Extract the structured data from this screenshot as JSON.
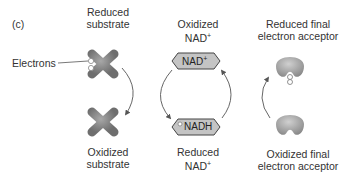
{
  "panel_label": "(c)",
  "left_column": {
    "top_label_line1": "Reduced",
    "top_label_line2": "substrate",
    "bottom_label_line1": "Oxidized",
    "bottom_label_line2": "substrate",
    "callout": "Electrons"
  },
  "middle_column": {
    "top_label_line1": "Oxidized",
    "top_label_line2": "NAD",
    "top_label_sup": "+",
    "top_hex_text": "NAD",
    "top_hex_sup": "+",
    "bottom_hex_text": "NADH",
    "bottom_label_line1": "Reduced",
    "bottom_label_line2": "NAD",
    "bottom_label_sup": "+"
  },
  "right_column": {
    "top_label_line1": "Reduced final",
    "top_label_line2": "electron acceptor",
    "bottom_label_line1": "Oxidized final",
    "bottom_label_line2": "electron acceptor"
  },
  "colors": {
    "substrate_gray": "#8a8a8a",
    "hex_fill": "#bdbdbd",
    "acceptor_gray": "#9a9a9a",
    "arrow": "#555555"
  }
}
